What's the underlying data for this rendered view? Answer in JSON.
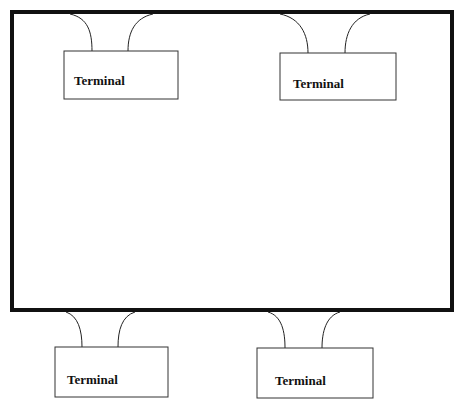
{
  "diagram": {
    "host": {
      "label": ""
    },
    "terminals": [
      {
        "id": "top-left",
        "label": "Terminal"
      },
      {
        "id": "top-right",
        "label": "Terminal"
      },
      {
        "id": "bottom-left",
        "label": "Terminal"
      },
      {
        "id": "bottom-right",
        "label": "Terminal"
      }
    ]
  },
  "colors": {
    "stroke": "#111111",
    "background": "#ffffff"
  }
}
